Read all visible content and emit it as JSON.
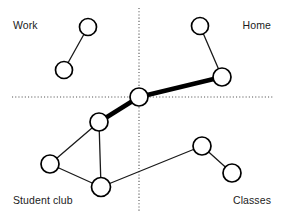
{
  "diagram": {
    "type": "network-graph",
    "canvas": {
      "width": 285,
      "height": 219
    },
    "colors": {
      "background": "#ffffff",
      "node_fill": "#ffffff",
      "node_stroke": "#000000",
      "edge": "#1a1a1a",
      "strong_edge": "#000000",
      "axis": "#555555",
      "label_text": "#1b1b1b"
    },
    "axes": {
      "horizontal": {
        "y": 97,
        "x_start": 12,
        "x_end": 273,
        "style": "dotted"
      },
      "vertical": {
        "x": 139,
        "y_start": 8,
        "y_end": 211,
        "style": "dotted"
      }
    },
    "quadrant_labels": [
      {
        "id": "work",
        "label": "Work",
        "position": "top-left"
      },
      {
        "id": "home",
        "label": "Home",
        "position": "top-right"
      },
      {
        "id": "student-club",
        "label": "Student club",
        "position": "bottom-left"
      },
      {
        "id": "classes",
        "label": "Classes",
        "position": "bottom-right"
      }
    ],
    "nodes": [
      {
        "id": "n1",
        "quadrant": "work",
        "x": 88,
        "y": 27,
        "r": 8.5
      },
      {
        "id": "n2",
        "quadrant": "work",
        "x": 64,
        "y": 70,
        "r": 8.5
      },
      {
        "id": "n3",
        "quadrant": "home",
        "x": 200,
        "y": 26,
        "r": 8.5
      },
      {
        "id": "n4",
        "quadrant": "home",
        "x": 222,
        "y": 77,
        "r": 9
      },
      {
        "id": "n5",
        "quadrant": "center",
        "x": 139,
        "y": 97,
        "r": 9
      },
      {
        "id": "n6",
        "quadrant": "student-club",
        "x": 99,
        "y": 122,
        "r": 9
      },
      {
        "id": "n7",
        "quadrant": "student-club",
        "x": 50,
        "y": 164,
        "r": 9
      },
      {
        "id": "n8",
        "quadrant": "student-club",
        "x": 101,
        "y": 187,
        "r": 9.5
      },
      {
        "id": "n9",
        "quadrant": "classes",
        "x": 202,
        "y": 146,
        "r": 9
      },
      {
        "id": "n10",
        "quadrant": "classes",
        "x": 232,
        "y": 173,
        "r": 9
      }
    ],
    "edges": [
      {
        "source": "n1",
        "target": "n2",
        "weight": "thin",
        "width": 1.3
      },
      {
        "source": "n3",
        "target": "n4",
        "weight": "thin",
        "width": 1.3
      },
      {
        "source": "n4",
        "target": "n5",
        "weight": "strong",
        "width": 4.6
      },
      {
        "source": "n5",
        "target": "n6",
        "weight": "strong",
        "width": 4.6
      },
      {
        "source": "n6",
        "target": "n7",
        "weight": "thin",
        "width": 1.3
      },
      {
        "source": "n6",
        "target": "n8",
        "weight": "thin",
        "width": 1.3
      },
      {
        "source": "n7",
        "target": "n8",
        "weight": "thin",
        "width": 1.3
      },
      {
        "source": "n8",
        "target": "n9",
        "weight": "thin",
        "width": 1.3
      },
      {
        "source": "n9",
        "target": "n10",
        "weight": "thin",
        "width": 1.3
      }
    ]
  }
}
